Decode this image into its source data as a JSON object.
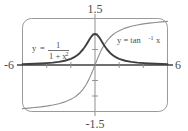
{
  "figure": {
    "title": "",
    "background": "#ffffff",
    "frame": {
      "name": "calculator-viewport-frame",
      "stroke": "#9a9a9a",
      "corner_radius": 9
    }
  },
  "axis_labels": {
    "y_max": "1.5",
    "y_min": "-1.5",
    "x_min": "-6",
    "x_max": "6"
  },
  "equations": {
    "curve1": {
      "y": "y",
      "equals": "=",
      "numerator": "1",
      "denominator_base": "1 + x",
      "denominator_exp": "2",
      "plain": "y = 1/(1 + x^2)"
    },
    "curve2": {
      "text_lead": "y = tan",
      "exponent": "-1",
      "variable": "x",
      "plain": "y = tan^-1 x"
    }
  },
  "colors": {
    "curve_agnesi": "#3f3f3f",
    "curve_arctan": "#8f8f8f",
    "axis": "#8a8a8a",
    "x_axis_dark": "#3f3f3f",
    "frame": "#9a9a9a",
    "text": "#4d4d4d"
  },
  "chart_data": {
    "type": "line",
    "title": "",
    "xlabel": "",
    "ylabel": "",
    "xlim": [
      -6,
      6
    ],
    "ylim": [
      -1.5,
      1.5
    ],
    "grid": false,
    "legend": "inline-annotations",
    "xticks": [
      -4,
      -2,
      2,
      4
    ],
    "yticks": [
      -1.0,
      -0.5,
      0.5,
      1.0
    ],
    "xtick_labels": [
      "-6",
      "6"
    ],
    "ytick_labels": [
      "1.5",
      "-1.5"
    ],
    "series": [
      {
        "name": "y = 1/(1 + x^2)",
        "color": "#3f3f3f",
        "width": 1.9,
        "x": [
          -6,
          -5.5,
          -5,
          -4.5,
          -4,
          -3.5,
          -3,
          -2.5,
          -2,
          -1.75,
          -1.5,
          -1.25,
          -1,
          -0.85,
          -0.7,
          -0.55,
          -0.4,
          -0.3,
          -0.2,
          -0.1,
          0,
          0.1,
          0.2,
          0.3,
          0.4,
          0.55,
          0.7,
          0.85,
          1,
          1.25,
          1.5,
          1.75,
          2,
          2.5,
          3,
          3.5,
          4,
          4.5,
          5,
          5.5,
          6
        ],
        "y": [
          0.027,
          0.032,
          0.038,
          0.047,
          0.059,
          0.075,
          0.1,
          0.138,
          0.2,
          0.246,
          0.308,
          0.39,
          0.5,
          0.58,
          0.671,
          0.768,
          0.862,
          0.917,
          0.962,
          0.99,
          1.0,
          0.99,
          0.962,
          0.917,
          0.862,
          0.768,
          0.671,
          0.58,
          0.5,
          0.39,
          0.308,
          0.246,
          0.2,
          0.138,
          0.1,
          0.075,
          0.059,
          0.047,
          0.038,
          0.032,
          0.027
        ]
      },
      {
        "name": "y = tan^-1 x",
        "color": "#8f8f8f",
        "width": 1.1,
        "x": [
          -6,
          -5.5,
          -5,
          -4.5,
          -4,
          -3.5,
          -3,
          -2.5,
          -2,
          -1.75,
          -1.5,
          -1.25,
          -1,
          -0.75,
          -0.5,
          -0.25,
          0,
          0.25,
          0.5,
          0.75,
          1,
          1.25,
          1.5,
          1.75,
          2,
          2.5,
          3,
          3.5,
          4,
          4.5,
          5,
          5.5,
          6
        ],
        "y": [
          -1.406,
          -1.391,
          -1.373,
          -1.352,
          -1.326,
          -1.292,
          -1.249,
          -1.19,
          -1.107,
          -1.052,
          -0.983,
          -0.896,
          -0.785,
          -0.644,
          -0.464,
          -0.245,
          0,
          0.245,
          0.464,
          0.644,
          0.785,
          0.896,
          0.983,
          1.052,
          1.107,
          1.19,
          1.249,
          1.292,
          1.326,
          1.352,
          1.373,
          1.391,
          1.406
        ]
      }
    ],
    "annotations": [
      {
        "text": "y = 1/(1 + x^2)",
        "x": -3.6,
        "y": 0.62
      },
      {
        "text": "y = tan^-1 x",
        "x": 2.0,
        "y": 1.08
      }
    ]
  }
}
